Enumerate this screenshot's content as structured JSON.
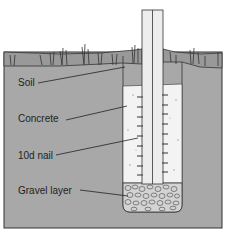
{
  "diagram": {
    "type": "cross-section",
    "labels": [
      {
        "id": "soil",
        "text": "Soil"
      },
      {
        "id": "concrete",
        "text": "Concrete"
      },
      {
        "id": "nail",
        "text": "10d nail"
      },
      {
        "id": "gravel",
        "text": "Gravel layer"
      }
    ],
    "colors": {
      "soil": "#a9a9a9",
      "grass_band": "#9a9a9a",
      "concrete": "#f2f2f2",
      "post": "#ececec",
      "outline": "#333333",
      "gravel": "#cfcfcf",
      "background": "#ffffff"
    }
  }
}
